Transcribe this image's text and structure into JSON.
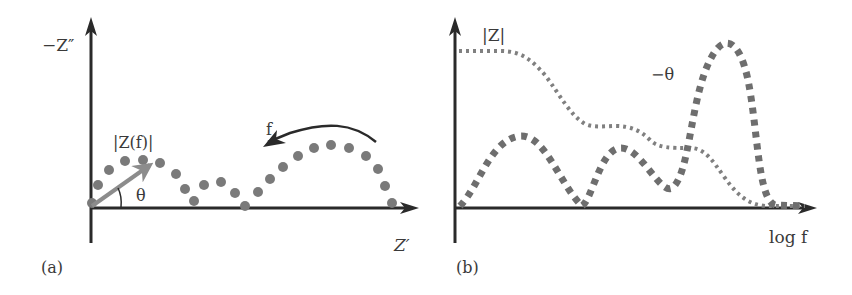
{
  "figure": {
    "panel_a": {
      "tag": "(a)",
      "y_axis_label": "−Z″",
      "x_axis_label": "Z′",
      "vector_label": "|Z(f)|",
      "angle_label": "θ",
      "frequency_label": "f",
      "description": "Nyquist plot: imaginary impedance vs real impedance, three arcs; arrow indicating increasing frequency direction (right to left)"
    },
    "panel_b": {
      "tag": "(b)",
      "magnitude_label": "|Z|",
      "phase_label": "−θ",
      "x_axis_label": "log f",
      "description": "Bode plot: |Z| (thin dotted, stepwise decreasing) and −θ (thick dotted, three peaks) vs log f"
    },
    "colors": {
      "axis": "#2a2a2a",
      "points": "#7a7a7a",
      "vector": "#8c8c8c",
      "magnitude_curve": "#808080",
      "phase_curve": "#6e6e6e",
      "text": "#3a3a3a"
    }
  }
}
